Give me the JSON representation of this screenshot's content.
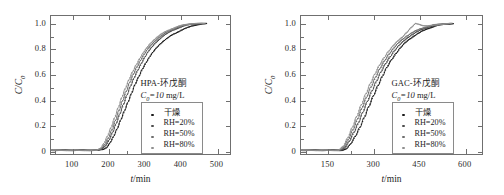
{
  "figure": {
    "background": "#ffffff",
    "axis_color": "#6f6f6f",
    "text_color": "#1c1c1c"
  },
  "chart_data": [
    {
      "type": "line",
      "panel": "left",
      "title": "HPA-环戊酮",
      "subtitle": "C₀=10 mg/L",
      "annotation_line1": "HPA-环戊酮",
      "annotation_line2_prefix": "C",
      "annotation_line2_sub": "0",
      "annotation_line2_rest": "=10 ",
      "annotation_line2_unit": "mg/L",
      "xlabel": "t/min",
      "xlabel_italic": "t",
      "xlabel_unit": "/min",
      "ylabel": "C/C₀",
      "ylabel_num": "C",
      "ylabel_den": "C",
      "ylabel_sub": "0",
      "xlim": [
        40,
        540
      ],
      "ylim": [
        -0.03,
        1.06
      ],
      "xticks": [
        100,
        200,
        300,
        400,
        500
      ],
      "xticklabels": [
        "100",
        "200",
        "300",
        "400",
        "500"
      ],
      "xminorticks": [
        50,
        150,
        250,
        350,
        450
      ],
      "yticks": [
        0,
        0.2,
        0.4,
        0.6,
        0.8,
        1.0
      ],
      "yticklabels": [
        "0",
        "0.2",
        "0.4",
        "0.6",
        "0.8",
        "1.0"
      ],
      "yminorticks": [
        0.1,
        0.3,
        0.5,
        0.7,
        0.9
      ],
      "grid": false,
      "legend_position": "lower-right",
      "series": [
        {
          "name": "干燥",
          "color": "#1a1a1a",
          "marker": "dot",
          "x": [
            40,
            80,
            120,
            150,
            170,
            185,
            195,
            205,
            215,
            225,
            235,
            245,
            255,
            265,
            275,
            285,
            295,
            305,
            315,
            325,
            335,
            345,
            355,
            365,
            375,
            385,
            395,
            405,
            415,
            425,
            435,
            445,
            455,
            465,
            475
          ],
          "y": [
            0.0,
            0.0,
            0.0,
            0.0,
            0.0,
            0.005,
            0.02,
            0.06,
            0.11,
            0.17,
            0.24,
            0.31,
            0.38,
            0.45,
            0.52,
            0.58,
            0.64,
            0.69,
            0.735,
            0.775,
            0.81,
            0.84,
            0.865,
            0.885,
            0.905,
            0.92,
            0.935,
            0.95,
            0.962,
            0.972,
            0.982,
            0.99,
            0.995,
            0.998,
            1.0
          ]
        },
        {
          "name": "RH=20%",
          "color": "#4d4d4d",
          "marker": "dot",
          "x": [
            40,
            80,
            120,
            150,
            170,
            182,
            192,
            202,
            212,
            222,
            232,
            242,
            252,
            262,
            272,
            282,
            292,
            302,
            312,
            322,
            332,
            342,
            352,
            362,
            372,
            382,
            392,
            402,
            412,
            422,
            432,
            442,
            452,
            462,
            472
          ],
          "y": [
            0.0,
            0.0,
            0.0,
            0.0,
            0.0,
            0.01,
            0.035,
            0.08,
            0.14,
            0.21,
            0.285,
            0.36,
            0.435,
            0.505,
            0.57,
            0.63,
            0.685,
            0.735,
            0.78,
            0.815,
            0.848,
            0.875,
            0.9,
            0.918,
            0.935,
            0.95,
            0.962,
            0.972,
            0.982,
            0.99,
            0.995,
            0.998,
            1.0,
            1.0,
            1.0
          ]
        },
        {
          "name": "RH=50%",
          "color": "#6e6e6e",
          "marker": "dot",
          "x": [
            40,
            80,
            120,
            150,
            168,
            180,
            190,
            200,
            210,
            220,
            230,
            240,
            250,
            260,
            270,
            280,
            290,
            300,
            310,
            320,
            330,
            340,
            350,
            360,
            370,
            380,
            390,
            400,
            410,
            420,
            430,
            440,
            450,
            460,
            470
          ],
          "y": [
            0.0,
            0.0,
            0.0,
            0.0,
            0.0,
            0.012,
            0.045,
            0.095,
            0.16,
            0.235,
            0.315,
            0.392,
            0.465,
            0.535,
            0.6,
            0.658,
            0.71,
            0.757,
            0.798,
            0.832,
            0.862,
            0.888,
            0.908,
            0.927,
            0.942,
            0.955,
            0.967,
            0.977,
            0.986,
            0.993,
            0.997,
            1.0,
            1.0,
            1.0,
            1.0
          ]
        },
        {
          "name": "RH=80%",
          "color": "#8f8f8f",
          "marker": "dot",
          "x": [
            40,
            80,
            120,
            150,
            166,
            178,
            188,
            198,
            208,
            218,
            228,
            238,
            248,
            258,
            268,
            278,
            288,
            298,
            308,
            318,
            328,
            338,
            348,
            358,
            368,
            378,
            388,
            398,
            408,
            418,
            428,
            438,
            448,
            458,
            468
          ],
          "y": [
            0.0,
            0.0,
            0.0,
            0.0,
            0.0,
            0.015,
            0.055,
            0.112,
            0.18,
            0.258,
            0.338,
            0.418,
            0.49,
            0.558,
            0.62,
            0.675,
            0.725,
            0.77,
            0.81,
            0.845,
            0.873,
            0.897,
            0.917,
            0.934,
            0.948,
            0.96,
            0.971,
            0.98,
            0.988,
            0.994,
            0.998,
            1.0,
            1.0,
            1.0,
            1.0
          ]
        }
      ]
    },
    {
      "type": "line",
      "panel": "right",
      "title": "GAC-环戊酮",
      "subtitle": "C₀=10 mg/L",
      "annotation_line1": "GAC-环戊酮",
      "annotation_line2_prefix": "C",
      "annotation_line2_sub": "0",
      "annotation_line2_rest": "=10 ",
      "annotation_line2_unit": "mg/L",
      "xlabel": "t/min",
      "xlabel_italic": "t",
      "xlabel_unit": "/min",
      "ylabel": "C/C₀",
      "ylabel_num": "C",
      "ylabel_den": "C",
      "ylabel_sub": "0",
      "xlim": [
        60,
        660
      ],
      "ylim": [
        -0.03,
        1.06
      ],
      "xticks": [
        150,
        300,
        450,
        600
      ],
      "xticklabels": [
        "150",
        "300",
        "450",
        "600"
      ],
      "xminorticks": [
        75,
        225,
        375,
        525
      ],
      "yticks": [
        0,
        0.2,
        0.4,
        0.6,
        0.8,
        1.0
      ],
      "yticklabels": [
        "0",
        "0.2",
        "0.4",
        "0.6",
        "0.8",
        "1.0"
      ],
      "yminorticks": [
        0.1,
        0.3,
        0.5,
        0.7,
        0.9
      ],
      "grid": false,
      "legend_position": "lower-right",
      "series": [
        {
          "name": "干燥",
          "color": "#1a1a1a",
          "marker": "dot",
          "x": [
            60,
            110,
            160,
            195,
            210,
            225,
            240,
            255,
            270,
            285,
            300,
            315,
            330,
            345,
            360,
            375,
            390,
            405,
            420,
            435,
            450,
            465,
            480,
            495,
            510,
            525,
            540,
            555,
            565
          ],
          "y": [
            0.0,
            0.0,
            0.0,
            0.0,
            0.01,
            0.05,
            0.11,
            0.18,
            0.26,
            0.345,
            0.43,
            0.51,
            0.585,
            0.655,
            0.715,
            0.765,
            0.81,
            0.848,
            0.878,
            0.903,
            0.925,
            0.944,
            0.96,
            0.973,
            0.984,
            0.991,
            0.996,
            0.999,
            1.0
          ]
        },
        {
          "name": "RH=20%",
          "color": "#4d4d4d",
          "marker": "dot",
          "x": [
            60,
            110,
            160,
            190,
            205,
            220,
            235,
            250,
            265,
            280,
            295,
            310,
            325,
            340,
            355,
            370,
            385,
            400,
            415,
            430,
            445,
            460,
            475,
            490,
            505,
            520,
            535,
            550,
            562
          ],
          "y": [
            0.0,
            0.0,
            0.0,
            0.0,
            0.018,
            0.07,
            0.14,
            0.215,
            0.3,
            0.385,
            0.468,
            0.545,
            0.618,
            0.682,
            0.738,
            0.787,
            0.828,
            0.862,
            0.892,
            0.916,
            0.936,
            0.953,
            0.967,
            0.978,
            0.987,
            0.993,
            0.997,
            1.0,
            1.0
          ]
        },
        {
          "name": "RH=50%",
          "color": "#6e6e6e",
          "marker": "dot",
          "x": [
            60,
            110,
            160,
            188,
            202,
            217,
            232,
            247,
            262,
            277,
            292,
            307,
            322,
            337,
            352,
            367,
            382,
            397,
            412,
            427,
            442,
            457,
            472,
            487,
            502,
            517,
            532,
            547,
            560
          ],
          "y": [
            0.0,
            0.0,
            0.0,
            0.0,
            0.025,
            0.085,
            0.162,
            0.245,
            0.332,
            0.418,
            0.5,
            0.576,
            0.645,
            0.707,
            0.76,
            0.806,
            0.845,
            0.877,
            0.904,
            0.927,
            0.945,
            0.96,
            0.972,
            0.982,
            0.99,
            0.995,
            0.998,
            1.0,
            1.0
          ]
        },
        {
          "name": "RH=80%",
          "color": "#8f8f8f",
          "marker": "dot",
          "x": [
            60,
            110,
            160,
            185,
            200,
            215,
            230,
            245,
            260,
            275,
            290,
            305,
            320,
            335,
            350,
            365,
            380,
            395,
            410,
            425,
            440,
            450,
            465,
            480,
            495,
            510,
            525,
            540,
            558
          ],
          "y": [
            0.0,
            0.0,
            0.0,
            0.0,
            0.03,
            0.098,
            0.18,
            0.268,
            0.358,
            0.445,
            0.527,
            0.602,
            0.67,
            0.73,
            0.781,
            0.824,
            0.861,
            0.892,
            0.93,
            0.968,
            1.0,
            0.995,
            0.985,
            0.982,
            0.985,
            0.99,
            0.995,
            0.998,
            1.0
          ]
        }
      ]
    }
  ]
}
